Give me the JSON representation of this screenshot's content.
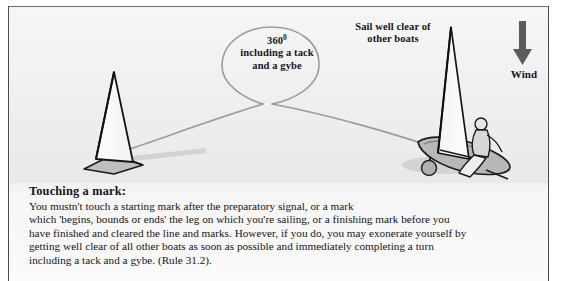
{
  "diagram": {
    "labels": {
      "turn_value": "360",
      "turn_degree_symbol": "0",
      "turn_line2": "including a tack",
      "turn_line3": "and a gybe",
      "clear_line1": "Sail well clear of",
      "clear_line2": "other boats",
      "wind": "Wind"
    },
    "icons": {
      "wind_arrow": "down-arrow-icon",
      "left_boat": "sailboat-stern-view-icon",
      "right_boat": "sailboat-with-sailor-icon",
      "mark_buoy": "mark-buoy-icon",
      "track_path": "boat-track-loop-path"
    },
    "colors": {
      "background_top": "#f7f7f7",
      "background_bottom": "#fbfbfb",
      "track_line": "#9a9a9a",
      "wind_arrow": "#5a5a5a",
      "hull_grey": "#b6b6b6",
      "sail_white": "#fdfdfd",
      "outline_black": "#1b1b1b",
      "frame_border": "#4a4a4c"
    }
  },
  "caption": {
    "title": "Touching a mark:",
    "lines": [
      "You mustn't touch a starting mark after the preparatory signal, or a mark",
      "which 'begins, bounds or ends' the leg on which you're sailing, or a finishing mark before you",
      "have finished and cleared the line and marks. However, if you do, you may exonerate yourself by",
      "getting well clear of all other boats as soon as possible and immediately completing a turn",
      "including a tack and a gybe. (Rule 31.2)."
    ]
  }
}
